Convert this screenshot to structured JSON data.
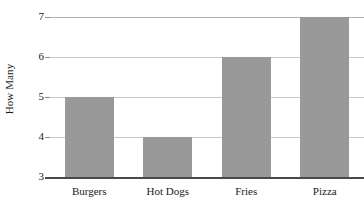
{
  "chart_data": {
    "type": "bar",
    "title": "",
    "subtitle": "",
    "xlabel": "",
    "ylabel": "How Many",
    "categories": [
      "Burgers",
      "Hot Dogs",
      "Fries",
      "Pizza"
    ],
    "values": [
      5,
      4,
      6,
      7
    ],
    "ylim": [
      3,
      7
    ],
    "yticks": [
      3,
      4,
      5,
      6,
      7
    ],
    "ytick_labels": [
      "3",
      "4",
      "5",
      "6",
      "7"
    ],
    "grid": true,
    "legend": false,
    "legend_position": "none",
    "bar_color": "#999999",
    "gridline_color": "#c9c9c9",
    "axis_color": "#4a4a4a",
    "text_color": "#1a1a1a",
    "series": [
      {
        "name": "How Many",
        "values": [
          5,
          4,
          6,
          7
        ]
      }
    ]
  },
  "axes": {
    "y_title": "How Many"
  }
}
